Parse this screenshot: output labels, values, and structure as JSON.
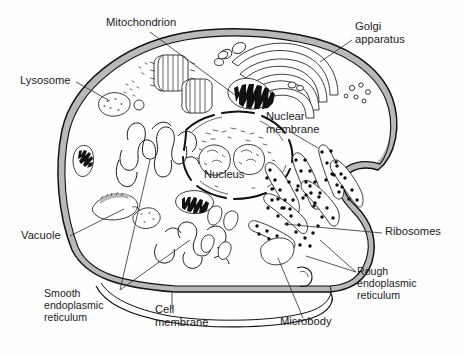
{
  "diagram": {
    "style": "black-and-white line drawing",
    "background_color": "#fefefe",
    "ink_color": "#111111",
    "membrane_fill_color": "#b9b9b9"
  },
  "labels": [
    {
      "id": "mitochondrion",
      "text": "Mitochondrion",
      "lines": [
        "Mitochondrion"
      ],
      "x": 106,
      "y": 26,
      "anchor": "start"
    },
    {
      "id": "golgi",
      "text": "Golgi apparatus",
      "lines": [
        "Golgi",
        "apparatus"
      ],
      "x": 355,
      "y": 30,
      "anchor": "start"
    },
    {
      "id": "lysosome",
      "text": "Lysosome",
      "lines": [
        "Lysosome"
      ],
      "x": 20,
      "y": 84,
      "anchor": "start"
    },
    {
      "id": "nuclear-membrane",
      "text": "Nuclear membrane",
      "lines": [
        "Nuclear",
        "membrane"
      ],
      "x": 266,
      "y": 120,
      "anchor": "start"
    },
    {
      "id": "nucleus",
      "text": "Nucleus",
      "lines": [
        "Nucleus"
      ],
      "x": 204,
      "y": 178,
      "anchor": "start"
    },
    {
      "id": "ribosomes",
      "text": "Ribosomes",
      "lines": [
        "Ribosomes"
      ],
      "x": 385,
      "y": 235,
      "anchor": "start"
    },
    {
      "id": "vacuole",
      "text": "Vacuole",
      "lines": [
        "Vacuole"
      ],
      "x": 21,
      "y": 239,
      "anchor": "start"
    },
    {
      "id": "rough-er",
      "text": "Rough endoplasmic reticulum",
      "lines": [
        "Rough",
        "endoplasmic",
        "reticulum"
      ],
      "x": 357,
      "y": 275,
      "anchor": "start"
    },
    {
      "id": "smooth-er",
      "text": "Smooth endoplasmic reticulum",
      "lines": [
        "Smooth",
        "endoplasmic",
        "reticulum"
      ],
      "x": 44,
      "y": 297,
      "anchor": "start"
    },
    {
      "id": "cell-membrane",
      "text": "Cell membrane",
      "lines": [
        "Cell",
        "membrane"
      ],
      "x": 155,
      "y": 313,
      "anchor": "start"
    },
    {
      "id": "microbody",
      "text": "Microbody",
      "lines": [
        "Microbody"
      ],
      "x": 280,
      "y": 325,
      "anchor": "start"
    }
  ],
  "organelles": [
    {
      "id": "cell-membrane-outline",
      "name": "cell membrane"
    },
    {
      "id": "nucleus-body",
      "name": "nucleus"
    },
    {
      "id": "nucleolus-left",
      "name": "nucleolus"
    },
    {
      "id": "nucleolus-right",
      "name": "nucleolus"
    },
    {
      "id": "nuclear-envelope",
      "name": "nuclear membrane"
    },
    {
      "id": "golgi-stack",
      "name": "Golgi apparatus"
    },
    {
      "id": "mitochondrion-top",
      "name": "mitochondrion"
    },
    {
      "id": "mitochondrion-left",
      "name": "mitochondrion"
    },
    {
      "id": "mitochondrion-center",
      "name": "mitochondrion"
    },
    {
      "id": "lysosome-body",
      "name": "lysosome"
    },
    {
      "id": "vacuole-body",
      "name": "vacuole"
    },
    {
      "id": "microbody-body",
      "name": "microbody"
    },
    {
      "id": "rough-er-network",
      "name": "rough endoplasmic reticulum"
    },
    {
      "id": "smooth-er-network",
      "name": "smooth endoplasmic reticulum"
    },
    {
      "id": "centriole-pair",
      "name": "centrioles"
    },
    {
      "id": "free-ribosome-cluster",
      "name": "free ribosomes"
    },
    {
      "id": "vesicle-cluster",
      "name": "vesicles"
    }
  ]
}
